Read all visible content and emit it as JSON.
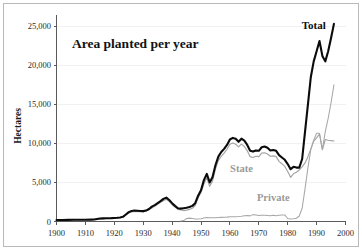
{
  "figure": {
    "title": "Area planted per year",
    "frame_color": "#b9b9b9",
    "background": "#ffffff"
  },
  "chart_data": {
    "type": "line",
    "title": "Area planted per year",
    "xlabel": "",
    "ylabel": "Hectares",
    "xlim": [
      1900,
      2000
    ],
    "ylim": [
      0,
      26500
    ],
    "grid": false,
    "legend_position": "inline-annotations",
    "xticks": [
      1900,
      1910,
      1920,
      1930,
      1940,
      1950,
      1960,
      1970,
      1980,
      1990,
      2000
    ],
    "xtick_labels": [
      "1900",
      "1910",
      "1920",
      "1930",
      "1940",
      "1950",
      "1960",
      "1970",
      "1980",
      "1990",
      "2000"
    ],
    "yticks": [
      0,
      5000,
      10000,
      15000,
      20000,
      25000
    ],
    "ytick_labels": [
      "0",
      "5,000",
      "10,000",
      "15,000",
      "20,000",
      "25,000"
    ],
    "annotations": [
      {
        "text": "Total",
        "x": 1989,
        "y": 24600,
        "color": "#0d0d0d"
      },
      {
        "text": "State",
        "x": 1964,
        "y": 6400,
        "color": "#9a9a9a"
      },
      {
        "text": "Private",
        "x": 1975,
        "y": 2600,
        "color": "#9a9a9a"
      }
    ],
    "series": [
      {
        "name": "Total",
        "color": "#0b0b0b",
        "linewidth": 2.1,
        "x": [
          1900,
          1902,
          1904,
          1906,
          1908,
          1910,
          1912,
          1913,
          1914,
          1915,
          1916,
          1917,
          1918,
          1919,
          1920,
          1921,
          1922,
          1923,
          1924,
          1925,
          1926,
          1927,
          1928,
          1929,
          1930,
          1931,
          1932,
          1933,
          1934,
          1935,
          1936,
          1937,
          1938,
          1939,
          1940,
          1941,
          1942,
          1943,
          1944,
          1945,
          1946,
          1947,
          1948,
          1949,
          1950,
          1951,
          1952,
          1953,
          1954,
          1955,
          1956,
          1957,
          1958,
          1959,
          1960,
          1961,
          1962,
          1963,
          1964,
          1965,
          1966,
          1967,
          1968,
          1969,
          1970,
          1971,
          1972,
          1973,
          1974,
          1975,
          1976,
          1977,
          1978,
          1979,
          1980,
          1981,
          1982,
          1983,
          1984,
          1985,
          1986,
          1987,
          1988,
          1989,
          1990,
          1991,
          1992,
          1993,
          1994,
          1995,
          1996
        ],
        "values": [
          200,
          200,
          210,
          215,
          220,
          230,
          240,
          250,
          330,
          380,
          400,
          410,
          420,
          430,
          450,
          480,
          520,
          600,
          900,
          1200,
          1350,
          1400,
          1380,
          1350,
          1330,
          1400,
          1600,
          1900,
          2100,
          2350,
          2600,
          2900,
          3050,
          2750,
          2350,
          2000,
          1700,
          1650,
          1700,
          1750,
          1850,
          2000,
          2350,
          3300,
          4000,
          5300,
          6100,
          5000,
          5700,
          7200,
          8300,
          8900,
          9300,
          9800,
          10500,
          10700,
          10600,
          10200,
          10600,
          10350,
          9800,
          9050,
          8950,
          9100,
          9050,
          9500,
          9600,
          9450,
          9100,
          9150,
          9050,
          8500,
          8200,
          7900,
          7350,
          6700,
          7000,
          6900,
          6900,
          8000,
          11500,
          15000,
          18500,
          20500,
          21800,
          23100,
          21200,
          20500,
          21800,
          23500,
          25300
        ]
      },
      {
        "name": "State",
        "color": "#a3a3a3",
        "linewidth": 1.15,
        "x": [
          1900,
          1905,
          1910,
          1913,
          1915,
          1918,
          1920,
          1922,
          1924,
          1925,
          1926,
          1928,
          1930,
          1932,
          1934,
          1936,
          1938,
          1939,
          1940,
          1942,
          1944,
          1945,
          1946,
          1947,
          1948,
          1949,
          1950,
          1951,
          1952,
          1953,
          1954,
          1955,
          1956,
          1957,
          1958,
          1959,
          1960,
          1961,
          1962,
          1963,
          1964,
          1965,
          1966,
          1967,
          1968,
          1969,
          1970,
          1971,
          1972,
          1973,
          1974,
          1975,
          1976,
          1977,
          1978,
          1979,
          1980,
          1981,
          1982,
          1983,
          1984,
          1985,
          1986,
          1987,
          1988,
          1989,
          1990,
          1991,
          1992,
          1993,
          1994,
          1995,
          1996
        ],
        "values": [
          180,
          190,
          210,
          230,
          300,
          380,
          420,
          480,
          820,
          1100,
          1250,
          1280,
          1230,
          1500,
          1950,
          2450,
          2850,
          2550,
          2150,
          1550,
          1400,
          1450,
          1550,
          1700,
          2050,
          3000,
          3700,
          4800,
          5600,
          4500,
          5200,
          6700,
          7800,
          8350,
          8750,
          9250,
          9900,
          10050,
          9900,
          9550,
          9900,
          9600,
          9050,
          8300,
          8200,
          8350,
          8300,
          8750,
          8800,
          8650,
          8350,
          8400,
          8300,
          7700,
          7400,
          7050,
          6400,
          5650,
          6100,
          6300,
          6600,
          7000,
          7500,
          8300,
          9300,
          10300,
          10700,
          11200,
          9200,
          10500,
          10400,
          10350,
          10300
        ]
      },
      {
        "name": "Private",
        "color": "#a8a8a8",
        "linewidth": 1.05,
        "x": [
          1943,
          1944,
          1945,
          1946,
          1947,
          1948,
          1949,
          1950,
          1951,
          1952,
          1953,
          1954,
          1955,
          1956,
          1957,
          1958,
          1959,
          1960,
          1961,
          1962,
          1963,
          1964,
          1965,
          1966,
          1967,
          1968,
          1969,
          1970,
          1971,
          1972,
          1973,
          1974,
          1975,
          1976,
          1977,
          1978,
          1979,
          1980,
          1981,
          1982,
          1983,
          1984,
          1985,
          1986,
          1987,
          1988,
          1989,
          1990,
          1991,
          1992,
          1993,
          1994,
          1995,
          1996
        ],
        "values": [
          60,
          120,
          380,
          430,
          380,
          330,
          330,
          350,
          450,
          500,
          480,
          470,
          470,
          500,
          530,
          540,
          560,
          600,
          620,
          620,
          640,
          680,
          740,
          760,
          720,
          880,
          840,
          760,
          800,
          790,
          780,
          740,
          800,
          740,
          800,
          820,
          840,
          380,
          330,
          360,
          420,
          700,
          1700,
          4200,
          6900,
          9200,
          10400,
          11300,
          11300,
          9200,
          11500,
          13200,
          15200,
          17500
        ]
      }
    ]
  },
  "axes": {
    "y_axis_title": "Hectares"
  }
}
